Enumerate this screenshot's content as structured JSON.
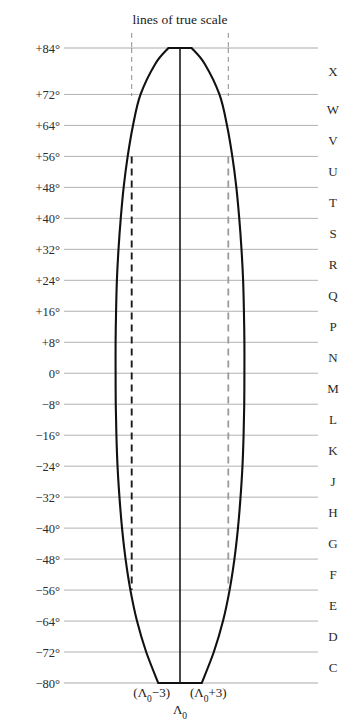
{
  "figure": {
    "title": "lines of true scale",
    "type": "utm-zone-diagram"
  },
  "chart_data": {
    "type": "line",
    "title": "lines of true scale",
    "xlabel": "",
    "ylabel": "",
    "ylim": [
      -84,
      88
    ],
    "xlim": [
      -4.2,
      4.2
    ],
    "grid": true,
    "legend": "none",
    "latitude_ticks": [
      "+84°",
      "+72°",
      "+64°",
      "+56°",
      "+48°",
      "+40°",
      "+32°",
      "+24°",
      "+16°",
      "+8°",
      "0°",
      "−8°",
      "−16°",
      "−24°",
      "−32°",
      "−40°",
      "−48°",
      "−56°",
      "−64°",
      "−72°",
      "−80°"
    ],
    "latitude_values": [
      84,
      72,
      64,
      56,
      48,
      40,
      32,
      24,
      16,
      8,
      0,
      -8,
      -16,
      -24,
      -32,
      -40,
      -48,
      -56,
      -64,
      -72,
      -80
    ],
    "zone_letters": [
      "X",
      "W",
      "V",
      "U",
      "T",
      "S",
      "R",
      "Q",
      "P",
      "N",
      "M",
      "L",
      "K",
      "J",
      "H",
      "G",
      "F",
      "E",
      "D",
      "C"
    ],
    "zone_letter_bands": [
      {
        "letter": "X",
        "from": 72,
        "to": 84
      },
      {
        "letter": "W",
        "from": 64,
        "to": 72
      },
      {
        "letter": "V",
        "from": 56,
        "to": 64
      },
      {
        "letter": "U",
        "from": 48,
        "to": 56
      },
      {
        "letter": "T",
        "from": 40,
        "to": 48
      },
      {
        "letter": "S",
        "from": 32,
        "to": 40
      },
      {
        "letter": "R",
        "from": 24,
        "to": 32
      },
      {
        "letter": "Q",
        "from": 16,
        "to": 24
      },
      {
        "letter": "P",
        "from": 8,
        "to": 16
      },
      {
        "letter": "N",
        "from": 0,
        "to": 8
      },
      {
        "letter": "M",
        "from": -8,
        "to": 0
      },
      {
        "letter": "L",
        "from": -16,
        "to": -8
      },
      {
        "letter": "K",
        "from": -24,
        "to": -16
      },
      {
        "letter": "J",
        "from": -32,
        "to": -24
      },
      {
        "letter": "H",
        "from": -40,
        "to": -32
      },
      {
        "letter": "G",
        "from": -48,
        "to": -40
      },
      {
        "letter": "F",
        "from": -56,
        "to": -48
      },
      {
        "letter": "E",
        "from": -64,
        "to": -56
      },
      {
        "letter": "D",
        "from": -72,
        "to": -64
      },
      {
        "letter": "C",
        "from": -80,
        "to": -72
      }
    ],
    "zone_outline": {
      "description": "Lens-shaped zone boundary, flat top at +84 and flat bottom at -80, widest at the equator",
      "half_width_by_latitude": [
        {
          "lat": 84,
          "half_width": 0.72
        },
        {
          "lat": 80,
          "half_width": 1.52
        },
        {
          "lat": 72,
          "half_width": 2.45
        },
        {
          "lat": 64,
          "half_width": 2.92
        },
        {
          "lat": 56,
          "half_width": 3.25
        },
        {
          "lat": 48,
          "half_width": 3.5
        },
        {
          "lat": 40,
          "half_width": 3.68
        },
        {
          "lat": 32,
          "half_width": 3.82
        },
        {
          "lat": 24,
          "half_width": 3.92
        },
        {
          "lat": 16,
          "half_width": 3.97
        },
        {
          "lat": 8,
          "half_width": 4.0
        },
        {
          "lat": 0,
          "half_width": 4.0
        },
        {
          "lat": -8,
          "half_width": 3.99
        },
        {
          "lat": -16,
          "half_width": 3.95
        },
        {
          "lat": -24,
          "half_width": 3.88
        },
        {
          "lat": -32,
          "half_width": 3.76
        },
        {
          "lat": -40,
          "half_width": 3.6
        },
        {
          "lat": -48,
          "half_width": 3.38
        },
        {
          "lat": -56,
          "half_width": 3.08
        },
        {
          "lat": -64,
          "half_width": 2.67
        },
        {
          "lat": -72,
          "half_width": 2.1
        },
        {
          "lat": -80,
          "half_width": 1.35
        }
      ]
    },
    "true_scale_lines": [
      {
        "name": "western line of true scale",
        "x": -3,
        "label": "(Λ₀−3)",
        "style": "dashed",
        "from_lat": 56,
        "to_lat": -56
      },
      {
        "name": "eastern line of true scale",
        "x": 3,
        "label": "(Λ₀+3)",
        "style": "dashed",
        "from_lat": 56,
        "to_lat": -56
      }
    ],
    "central_meridian": {
      "name": "central meridian",
      "x": 0,
      "label": "Λ₀",
      "style": "solid"
    }
  },
  "axis": {
    "bottom_labels": {
      "west": "(Λ₀−3)",
      "east": "(Λ₀+3)",
      "center": "Λ₀"
    }
  },
  "colors": {
    "gridline": "#a9a9a9",
    "outline": "#111111",
    "dashed_west": "#1c1c1c",
    "dashed_east": "#9a9a9a",
    "text": "#2b2b2b",
    "background": "#ffffff"
  }
}
